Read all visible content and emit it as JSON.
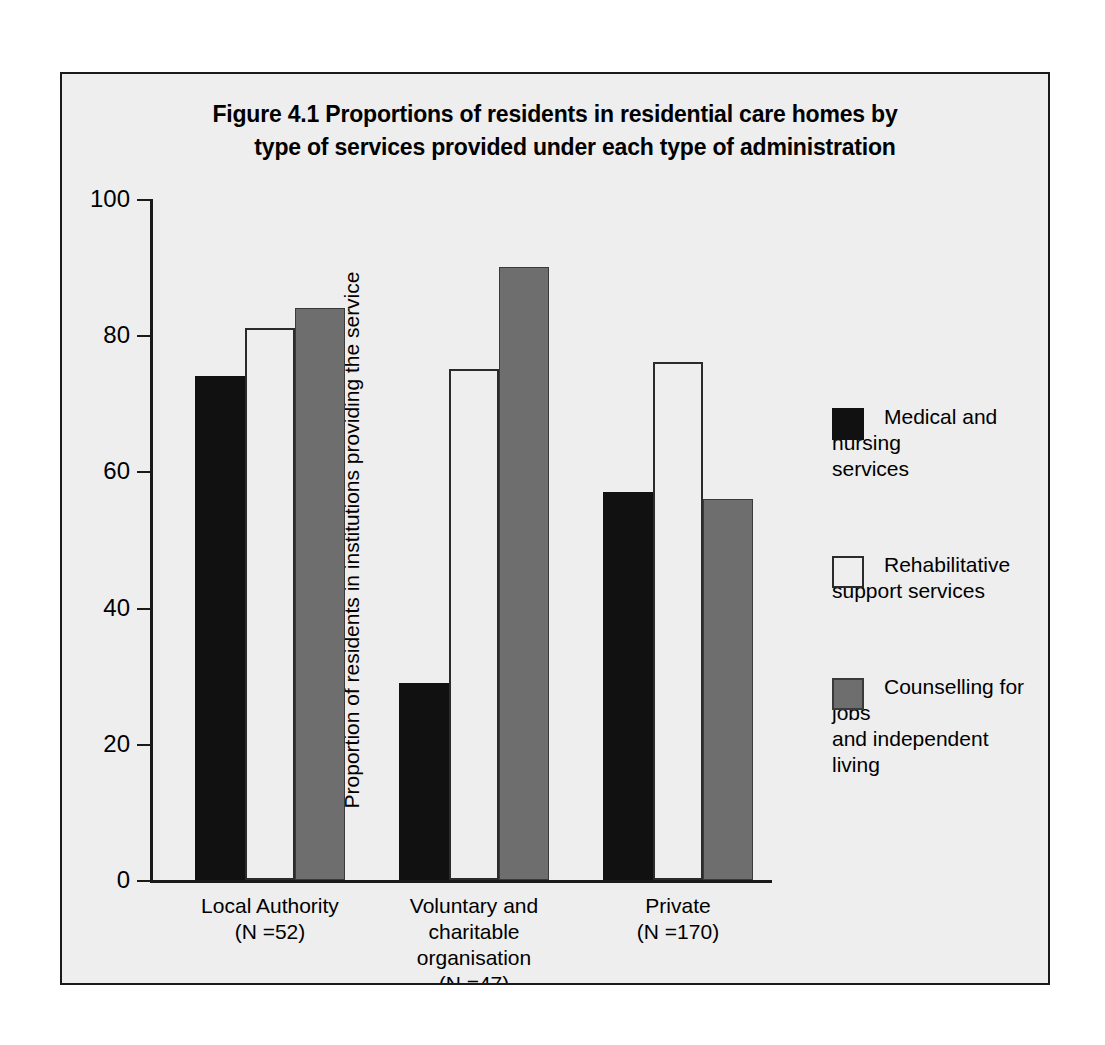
{
  "figure": {
    "title_line1": "Figure 4.1  Proportions of residents in residential care homes by",
    "title_line2": "type of services provided under each type of administration"
  },
  "axes": {
    "ylabel": "Proportion of residents in institutions providing the service",
    "yticks": [
      "0",
      "20",
      "40",
      "60",
      "80",
      "100"
    ]
  },
  "categories": [
    {
      "label": "Local Authority\n(N =52)"
    },
    {
      "label": "Voluntary and\ncharitable\norganisation\n(N =47)"
    },
    {
      "label": "Private\n(N =170)"
    }
  ],
  "legend": [
    {
      "label": "Medical and nursing\nservices",
      "color": "#111111"
    },
    {
      "label": "Rehabilitative\nsupport services",
      "color": "#ffffff"
    },
    {
      "label": "Counselling for jobs\nand independent\nliving",
      "color": "#6e6e6e"
    }
  ],
  "chart_data": {
    "type": "bar",
    "title": "Figure 4.1  Proportions of residents in residential care homes by type of services provided under each type of administration",
    "xlabel": "",
    "ylabel": "Proportion of residents in institutions providing the service",
    "ylim": [
      0,
      100
    ],
    "yticks": [
      0,
      20,
      40,
      60,
      80,
      100
    ],
    "grid": false,
    "legend_position": "right",
    "categories": [
      "Local Authority (N =52)",
      "Voluntary and charitable organisation (N =47)",
      "Private (N =170)"
    ],
    "series": [
      {
        "name": "Medical and nursing services",
        "color": "#111111",
        "values": [
          74,
          29,
          57
        ]
      },
      {
        "name": "Rehabilitative support services",
        "color": "#ffffff",
        "values": [
          81,
          75,
          76
        ]
      },
      {
        "name": "Counselling for jobs and independent living",
        "color": "#6e6e6e",
        "values": [
          84,
          90,
          56
        ]
      }
    ]
  }
}
